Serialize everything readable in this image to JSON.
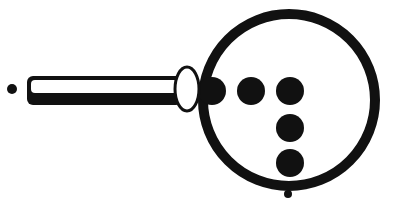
{
  "figure": {
    "colors": {
      "ink": "#111111",
      "background": "#ffffff",
      "lens_fill": "#ffffff"
    },
    "handle": {
      "x": 27,
      "y": 76,
      "width": 155,
      "height": 29
    },
    "collar": {
      "cx": 187,
      "cy": 89,
      "rx": 12,
      "ry": 22
    },
    "lens": {
      "cx": 289,
      "cy": 100,
      "r": 86,
      "stroke": 10
    },
    "dots": [
      {
        "cx": 212,
        "cy": 91,
        "r": 14
      },
      {
        "cx": 251,
        "cy": 91,
        "r": 14
      },
      {
        "cx": 290,
        "cy": 91,
        "r": 14
      },
      {
        "cx": 290,
        "cy": 128,
        "r": 14
      },
      {
        "cx": 290,
        "cy": 163,
        "r": 14
      }
    ],
    "small_dots": [
      {
        "cx": 12,
        "cy": 89,
        "r": 5
      },
      {
        "cx": 288,
        "cy": 194,
        "r": 4
      }
    ]
  }
}
